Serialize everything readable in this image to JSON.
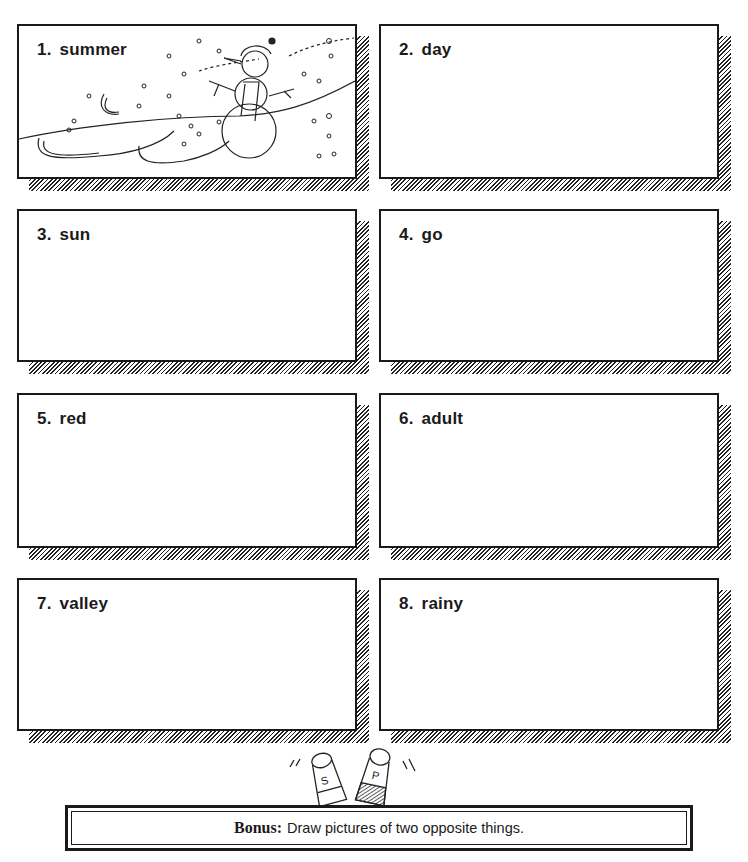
{
  "worksheet": {
    "items": [
      {
        "number": "1.",
        "word": "summer",
        "has_illustration": true,
        "illustration": "snowman-winter-scene"
      },
      {
        "number": "2.",
        "word": "day"
      },
      {
        "number": "3.",
        "word": "sun"
      },
      {
        "number": "4.",
        "word": "go"
      },
      {
        "number": "5.",
        "word": "red"
      },
      {
        "number": "6.",
        "word": "adult"
      },
      {
        "number": "7.",
        "word": "valley"
      },
      {
        "number": "8.",
        "word": "rainy"
      }
    ],
    "bonus": {
      "label": "Bonus:",
      "text": "Draw pictures of two opposite things."
    },
    "decoration": "salt-and-pepper-shakers",
    "colors": {
      "ink": "#1a1a1a",
      "paper": "#ffffff"
    }
  }
}
